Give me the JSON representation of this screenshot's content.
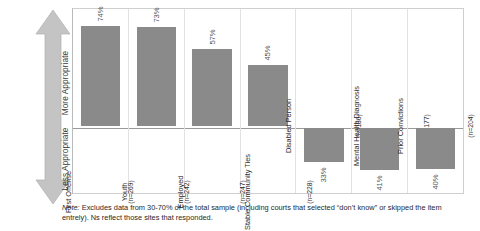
{
  "axis": {
    "top_label": "More Appropriate",
    "bottom_label": "Less Appropriate",
    "arrow_icon": "double-headed-vertical-arrow-icon"
  },
  "note": {
    "prefix": "Note:",
    "text": " Excludes data from 30-70% of the total sample (including courts that selected “don’t know” or skipped the item entrely). Ns reflect those sites that responded."
  },
  "colors": {
    "bar": "#8a8a8a",
    "arrow": "#c4c4c4",
    "plot_border": "#cfcfcf",
    "baseline": "#9a9a9a"
  },
  "chart_data": {
    "type": "bar",
    "title": "",
    "xlabel": "",
    "ylabel": "More Appropriate / Less Appropriate",
    "ylim": [
      0,
      100
    ],
    "grid": false,
    "legend": "none",
    "orientation": "vertical-diverging",
    "categories": [
      "First Offense",
      "Youth",
      "Employed",
      "Stable Community Ties",
      "Disabled Person",
      "Mental Health Diagnosis",
      "Prior Convictions"
    ],
    "n_values": [
      "(n=269)",
      "(n=242)",
      "(n=247)",
      "(n=228)",
      "(n=186)",
      "(n=177)",
      "(n=204)"
    ],
    "values": [
      74,
      73,
      57,
      45,
      33,
      41,
      40
    ],
    "value_labels": [
      "74%",
      "73%",
      "57%",
      "45%",
      "33%",
      "41%",
      "40%"
    ],
    "direction": [
      "up",
      "up",
      "up",
      "up",
      "down",
      "down",
      "down"
    ]
  }
}
